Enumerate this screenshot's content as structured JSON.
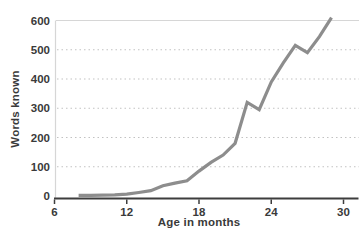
{
  "chart": {
    "ylabel": "Words known",
    "xlabel": "Age in months"
  },
  "chart_data": {
    "type": "line",
    "title": "",
    "xlabel": "Age in months",
    "ylabel": "Words known",
    "x": [
      8,
      9,
      10,
      11,
      12,
      13,
      14,
      15,
      16,
      17,
      18,
      19,
      20,
      21,
      22,
      23,
      24,
      25,
      26,
      27,
      28,
      29
    ],
    "values": [
      2,
      2,
      3,
      4,
      6,
      12,
      18,
      35,
      44,
      52,
      85,
      115,
      140,
      180,
      320,
      295,
      390,
      455,
      515,
      490,
      545,
      610
    ],
    "xticks": [
      6,
      12,
      18,
      24,
      30
    ],
    "yticks": [
      0,
      100,
      200,
      300,
      400,
      500,
      600
    ],
    "xlim": [
      6,
      30
    ],
    "ylim": [
      0,
      600
    ],
    "grid": "horizontal-dotted, solid top border at 600",
    "legend": "none",
    "colors": {
      "line": "#8d8d8d",
      "text": "#3a3a3a",
      "grid_dotted": "#c2c2c2",
      "grid_solid": "#d6d6d6",
      "axis": "#3d3d3d",
      "background": "#ffffff"
    }
  }
}
